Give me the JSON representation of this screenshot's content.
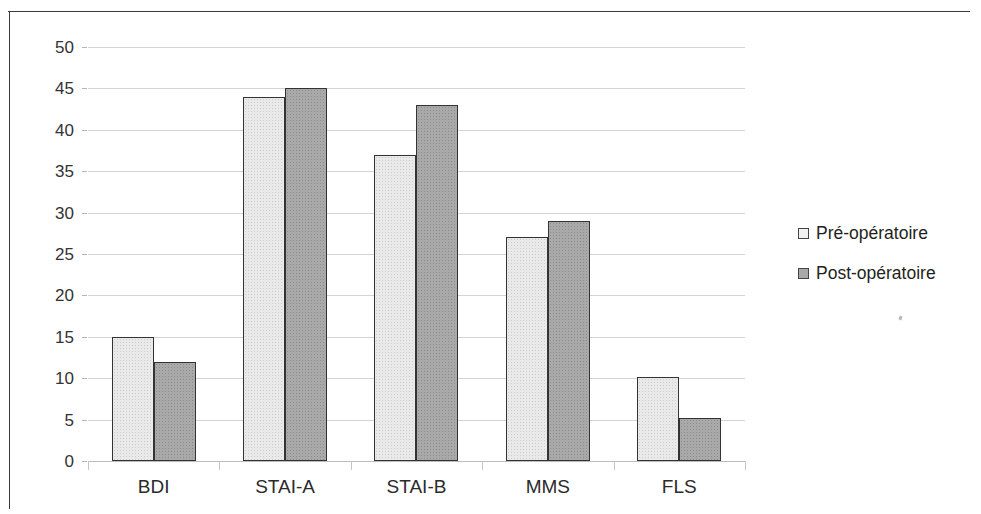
{
  "chart_data": {
    "type": "bar",
    "title": "",
    "subtitle": "",
    "xlabel": "",
    "ylabel": "",
    "categories": [
      "BDI",
      "STAI-A",
      "STAI-B",
      "MMS",
      "FLS"
    ],
    "series": [
      {
        "name": "Pré-opératoire",
        "color": "#e9e9e9",
        "values": [
          15,
          44,
          37,
          27,
          10.2
        ]
      },
      {
        "name": "Post-opératoire",
        "color": "#a9a9a9",
        "values": [
          12,
          45,
          43,
          29,
          5.2
        ]
      }
    ],
    "ylim": [
      0,
      50
    ],
    "yticks": [
      0,
      5,
      10,
      15,
      20,
      25,
      30,
      35,
      40,
      45,
      50
    ],
    "ytick_labels": [
      "0",
      "5",
      "10",
      "15",
      "20",
      "25",
      "30",
      "35",
      "40",
      "45",
      "50"
    ],
    "grid": true,
    "grid_axis": "y",
    "legend_position": "right",
    "annotations": []
  },
  "legend": {
    "items": [
      {
        "label": "Pré-opératoire",
        "swatch": "pre"
      },
      {
        "label": "Post-opératoire",
        "swatch": "post"
      }
    ]
  },
  "colors": {
    "pre_fill": "#e9e9e9",
    "post_fill": "#a9a9a9",
    "bar_outline": "#333333",
    "gridline": "#d3d3d3",
    "text": "#2b2b2b",
    "frame": "#3a3a3a"
  }
}
